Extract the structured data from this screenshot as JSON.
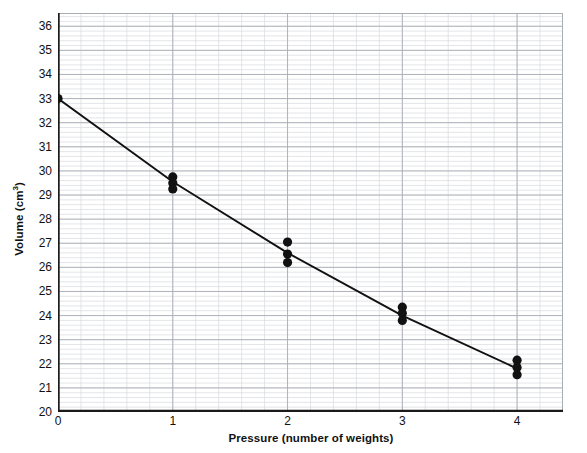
{
  "chart_data": {
    "type": "scatter",
    "title": "",
    "xlabel": "Pressure (number of weights)",
    "ylabel": "Volume (cm³)",
    "xlabel_plain": "Pressure (number of weights)",
    "ylabel_main": "Volume (cm",
    "ylabel_sup": "3",
    "ylabel_tail": ")",
    "xlim": [
      0,
      4.4
    ],
    "ylim": [
      20,
      36.55
    ],
    "xticks": [
      0,
      1,
      2,
      3,
      4
    ],
    "xtick_labels": [
      "0",
      "1",
      "2",
      "3",
      "4"
    ],
    "yticks": [
      20,
      21,
      22,
      23,
      24,
      25,
      26,
      27,
      28,
      29,
      30,
      31,
      32,
      33,
      34,
      35,
      36
    ],
    "ytick_labels": [
      "20",
      "21",
      "22",
      "23",
      "24",
      "25",
      "26",
      "27",
      "28",
      "29",
      "30",
      "31",
      "32",
      "33",
      "34",
      "35",
      "36"
    ],
    "grid": true,
    "grid_minor": true,
    "grid_minor_step_x": 0.2,
    "grid_minor_step_y": 0.2,
    "grid_major_step_x": 1,
    "grid_major_step_y": 1,
    "legend": "none",
    "point_color": "#111111",
    "line_color": "#111111",
    "grid_major_color": "#a9adb4",
    "grid_minor_color": "#d8dade",
    "axis_color": "#1a1a1a",
    "points": [
      {
        "x": 0,
        "y": 33.0
      },
      {
        "x": 1,
        "y": 29.75
      },
      {
        "x": 1,
        "y": 29.5
      },
      {
        "x": 1,
        "y": 29.25
      },
      {
        "x": 2,
        "y": 27.05
      },
      {
        "x": 2,
        "y": 26.55
      },
      {
        "x": 2,
        "y": 26.2
      },
      {
        "x": 3,
        "y": 24.35
      },
      {
        "x": 3,
        "y": 24.1
      },
      {
        "x": 3,
        "y": 23.8
      },
      {
        "x": 4,
        "y": 22.15
      },
      {
        "x": 4,
        "y": 21.85
      },
      {
        "x": 4,
        "y": 21.55
      }
    ],
    "trend_line": [
      {
        "x": 0,
        "y": 33.0
      },
      {
        "x": 1,
        "y": 29.55
      },
      {
        "x": 2,
        "y": 26.6
      },
      {
        "x": 3,
        "y": 24.0
      },
      {
        "x": 4,
        "y": 21.8
      }
    ]
  }
}
